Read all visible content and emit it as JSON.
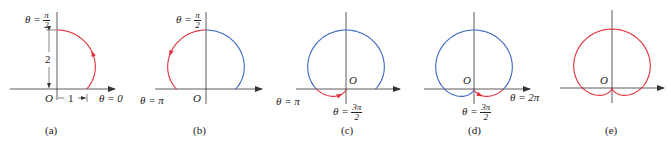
{
  "figure": {
    "curve": "r = 1 + sin θ",
    "colors": {
      "traced": "#e0303a",
      "previous": "#3a66c4",
      "axis": "#333333"
    },
    "panels": [
      {
        "caption": "(a)",
        "labels": {
          "top": "θ = ",
          "top_num": "π",
          "top_den": "2",
          "right": "θ = 0",
          "origin": "O",
          "height_dim": "2",
          "width_dim": "1"
        }
      },
      {
        "caption": "(b)",
        "labels": {
          "top": "θ = ",
          "top_num": "π",
          "top_den": "2",
          "left": "θ = π",
          "origin": "O"
        }
      },
      {
        "caption": "(c)",
        "labels": {
          "left": "θ = π",
          "bottom": "θ = ",
          "bottom_num": "3π",
          "bottom_den": "2",
          "origin": "O"
        }
      },
      {
        "caption": "(d)",
        "labels": {
          "right": "θ = 2π",
          "bottom": "θ = ",
          "bottom_num": "3π",
          "bottom_den": "2",
          "origin": "O"
        }
      },
      {
        "caption": "(e)",
        "labels": {
          "origin": "O"
        }
      }
    ]
  }
}
